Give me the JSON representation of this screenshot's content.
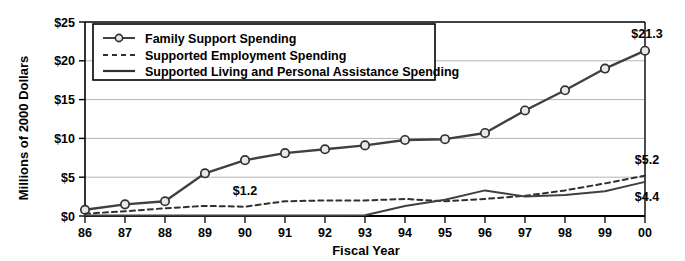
{
  "chart_data": {
    "type": "line",
    "title": "",
    "xlabel": "Fiscal Year",
    "ylabel": "Millions of 2000 Dollars",
    "categories": [
      "86",
      "87",
      "88",
      "89",
      "90",
      "91",
      "92",
      "93",
      "94",
      "95",
      "96",
      "97",
      "98",
      "99",
      "00"
    ],
    "ylim": [
      0,
      25
    ],
    "yticks": [
      0,
      5,
      10,
      15,
      20,
      25
    ],
    "ytick_labels": [
      "$0",
      "$5",
      "$10",
      "$15",
      "$20",
      "$25"
    ],
    "grid": "horizontal",
    "legend_position": "top-left-inside",
    "series": [
      {
        "name": "Family Support Spending",
        "style": "solid-with-circle-markers",
        "color": "#404040",
        "values": [
          0.8,
          1.5,
          1.9,
          5.5,
          7.2,
          8.1,
          8.6,
          9.1,
          9.8,
          9.9,
          10.7,
          13.6,
          16.2,
          19.0,
          21.3
        ]
      },
      {
        "name": "Supported Employment Spending",
        "style": "dashed",
        "color": "#303030",
        "values": [
          0.3,
          0.6,
          1.0,
          1.3,
          1.2,
          1.9,
          2.0,
          2.0,
          2.2,
          1.9,
          2.2,
          2.6,
          3.3,
          4.2,
          5.2
        ]
      },
      {
        "name": "Supported Living and Personal Assistance Spending",
        "style": "solid",
        "color": "#404040",
        "values": [
          0.05,
          0.05,
          0.05,
          0.05,
          0.05,
          0.05,
          0.05,
          0.1,
          1.3,
          2.1,
          3.3,
          2.5,
          2.7,
          3.2,
          4.4
        ]
      }
    ],
    "annotations": [
      {
        "text": "$1.2",
        "series": "Supported Employment Spending",
        "category": "90",
        "value": 1.2
      },
      {
        "text": "$21.3",
        "series": "Family Support Spending",
        "category": "00",
        "value": 21.3
      },
      {
        "text": "$5.2",
        "series": "Supported Employment Spending",
        "category": "00",
        "value": 5.2
      },
      {
        "text": "$4.4",
        "series": "Supported Living and Personal Assistance Spending",
        "category": "00",
        "value": 4.4
      }
    ]
  },
  "legend": {
    "items": [
      {
        "label": "Family Support Spending",
        "marker": "line-circle-marker"
      },
      {
        "label": "Supported Employment Spending",
        "marker": "dashed-line"
      },
      {
        "label": "Supported Living and Personal Assistance Spending",
        "marker": "solid-line"
      }
    ]
  },
  "colors": {
    "line": "#404040",
    "grid": "#b4b4b4",
    "axis": "#000000",
    "background": "#ffffff",
    "marker_fill": "#e8e8e8"
  }
}
